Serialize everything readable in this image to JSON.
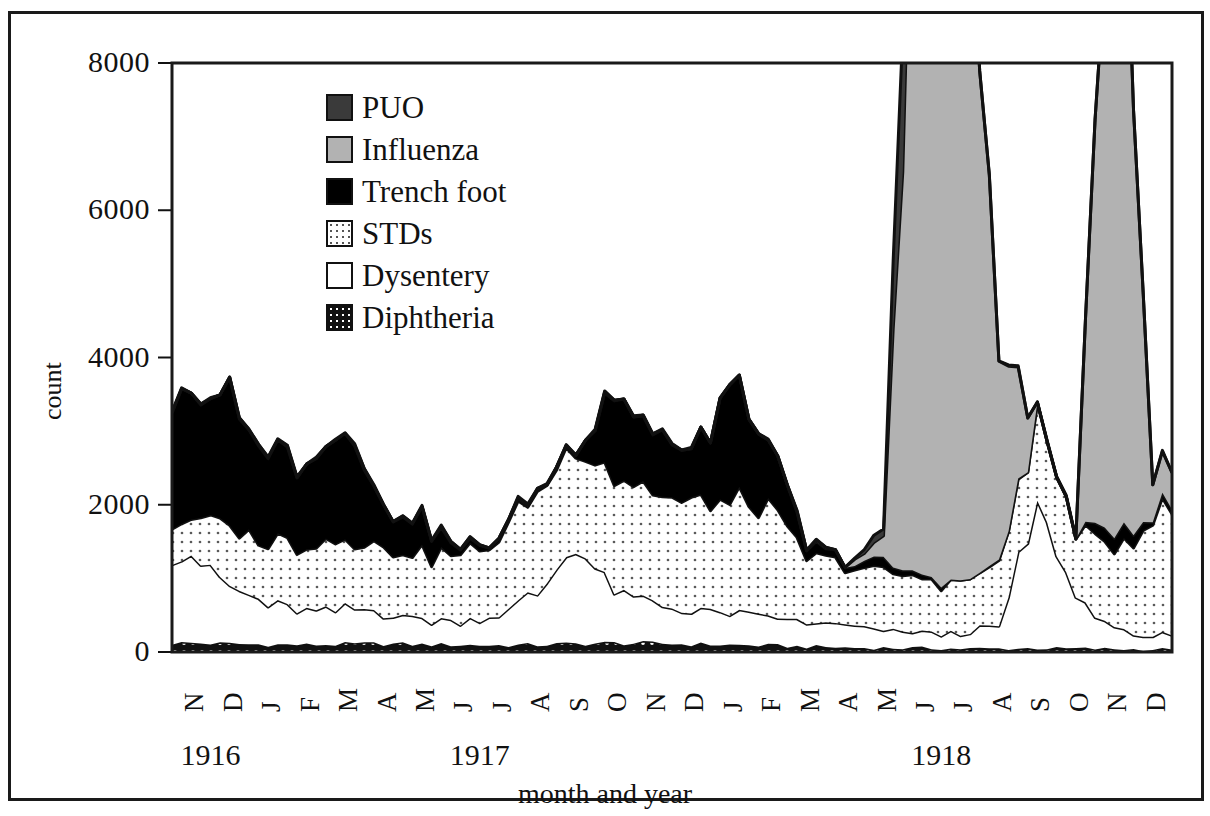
{
  "chart_data": {
    "type": "area",
    "stacked": true,
    "title": "",
    "xlabel": "month and year",
    "ylabel": "count",
    "ylim": [
      0,
      8000
    ],
    "yticks": [
      0,
      2000,
      4000,
      6000,
      8000
    ],
    "ytick_labels": [
      "0",
      "2000",
      "4000",
      "6000",
      "8000"
    ],
    "grid": false,
    "legend_position": "upper-left-inside",
    "x_axis_note": "weekly observations grouped by month; month initials shown rotated 90 degrees",
    "categories": [
      "N 1916",
      "D 1916",
      "J 1917",
      "F 1917",
      "M 1917",
      "A 1917",
      "M 1917",
      "J 1917",
      "J 1917",
      "A 1917",
      "S 1917",
      "O 1917",
      "N 1917",
      "D 1917",
      "J 1918",
      "F 1918",
      "M 1918",
      "A 1918",
      "M 1918",
      "J 1918",
      "J 1918",
      "A 1918",
      "S 1918",
      "O 1918",
      "N 1918",
      "D 1918"
    ],
    "month_ticks": [
      "N",
      "D",
      "J",
      "F",
      "M",
      "A",
      "M",
      "J",
      "J",
      "A",
      "S",
      "O",
      "N",
      "D",
      "J",
      "F",
      "M",
      "A",
      "M",
      "J",
      "J",
      "A",
      "S",
      "O",
      "N",
      "D"
    ],
    "year_groups": [
      {
        "label": "1916",
        "start_index": 0,
        "end_index": 1
      },
      {
        "label": "1917",
        "start_index": 2,
        "end_index": 13
      },
      {
        "label": "1918",
        "start_index": 14,
        "end_index": 25
      }
    ],
    "series": [
      {
        "name": "Diphtheria",
        "color": "#1a1a1a",
        "pattern": "dark-grid-dots",
        "stack_order": 1,
        "values": [
          120,
          110,
          100,
          95,
          105,
          110,
          100,
          95,
          90,
          95,
          110,
          120,
          115,
          105,
          95,
          85,
          70,
          60,
          55,
          50,
          45,
          45,
          50,
          45,
          40,
          35
        ]
      },
      {
        "name": "Dysentery",
        "color": "#ffffff",
        "pattern": "solid-white",
        "stack_order": 2,
        "values": [
          1230,
          760,
          560,
          450,
          470,
          430,
          340,
          330,
          420,
          700,
          1350,
          700,
          540,
          460,
          430,
          390,
          330,
          300,
          240,
          210,
          210,
          300,
          1900,
          700,
          260,
          190
        ]
      },
      {
        "name": "STDs",
        "color": "#ffffff",
        "pattern": "fine-dots",
        "stack_order": 3,
        "values": [
          520,
          780,
          840,
          900,
          950,
          900,
          880,
          900,
          1050,
          1350,
          1450,
          1550,
          1500,
          1450,
          1500,
          1450,
          900,
          800,
          780,
          720,
          700,
          800,
          1200,
          900,
          1100,
          1650
        ]
      },
      {
        "name": "Trench foot",
        "color": "#000000",
        "pattern": "solid-black",
        "stack_order": 4,
        "values": [
          1700,
          1800,
          1200,
          1180,
          1500,
          500,
          450,
          80,
          30,
          20,
          30,
          1100,
          900,
          700,
          1500,
          900,
          150,
          60,
          120,
          60,
          0,
          0,
          0,
          0,
          250,
          60
        ]
      },
      {
        "name": "Influenza",
        "color": "#b2b2b2",
        "pattern": "solid-light-gray",
        "stack_order": 5,
        "values": [
          0,
          0,
          0,
          0,
          0,
          0,
          0,
          0,
          0,
          0,
          0,
          0,
          0,
          0,
          0,
          0,
          0,
          0,
          300,
          12000,
          11000,
          3000,
          0,
          0,
          11000,
          500
        ]
      },
      {
        "name": "PUO",
        "color": "#3a3a3a",
        "pattern": "solid-dark-gray",
        "stack_order": 6,
        "values": [
          0,
          0,
          0,
          0,
          0,
          0,
          0,
          0,
          0,
          0,
          0,
          0,
          0,
          0,
          0,
          0,
          0,
          0,
          100,
          3500,
          0,
          0,
          0,
          0,
          0,
          0
        ]
      }
    ],
    "peaks_noted": [
      {
        "label": "Trench foot winter peak",
        "period": "N 1916 - M 1917",
        "approx_total": 3700
      },
      {
        "label": "STDs autumn peak",
        "period": "S 1917",
        "approx_total": 3200
      },
      {
        "label": "Trench foot peak",
        "period": "F 1918",
        "approx_total": 4500
      },
      {
        "label": "Influenza first wave (off-scale)",
        "period": "J 1918 - A 1918",
        "approx_total": ">8000"
      },
      {
        "label": "Dysentery / STDs peak",
        "period": "S 1918",
        "approx_total": 3200
      },
      {
        "label": "Influenza second wave (off-scale)",
        "period": "N 1918",
        "approx_total": ">8000"
      }
    ]
  },
  "legend": {
    "items": [
      {
        "label": "PUO",
        "swatch": "puo-swatch"
      },
      {
        "label": "Influenza",
        "swatch": "influenza-swatch"
      },
      {
        "label": "Trench foot",
        "swatch": "trench-foot-swatch"
      },
      {
        "label": "STDs",
        "swatch": "stds-swatch"
      },
      {
        "label": "Dysentery",
        "swatch": "dysentery-swatch"
      },
      {
        "label": "Diphtheria",
        "swatch": "diphtheria-swatch"
      }
    ]
  },
  "colors": {
    "puo": "#3a3a3a",
    "influenza": "#b2b2b2",
    "trench_foot": "#000000",
    "stds": "#ffffff",
    "dysentery": "#ffffff",
    "diphtheria": "#1a1a1a",
    "axis": "#111111",
    "frame": "#1a1a1a"
  }
}
